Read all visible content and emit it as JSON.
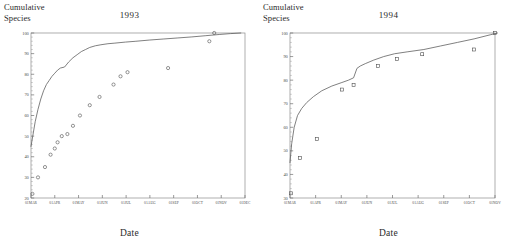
{
  "figure": {
    "panel_count": 2,
    "background_color": "#ffffff",
    "ink_color": "#4d4d4d"
  },
  "panels": [
    {
      "id": "panel-1993",
      "title": "1993",
      "ylabel_line1": "Cumulative",
      "ylabel_line2": "Species",
      "xlabel": "Date"
    },
    {
      "id": "panel-1994",
      "title": "1994",
      "ylabel_line1": "Cumulative",
      "ylabel_line2": "Species",
      "xlabel": "Date"
    }
  ],
  "chart_data": [
    {
      "type": "scatter",
      "title": "1993",
      "xlabel": "Date",
      "ylabel": "Cumulative Species",
      "grid": false,
      "legend": "none",
      "xlim": [
        "01MAR",
        "01DEC"
      ],
      "ylim": [
        20,
        100
      ],
      "yticks": [
        20,
        30,
        40,
        50,
        60,
        70,
        80,
        90,
        100
      ],
      "xticks": [
        "01MAR",
        "01APR",
        "01MAY",
        "01JUN",
        "01JUL",
        "01AUG",
        "01SEP",
        "01OCT",
        "01NOV",
        "01DEC"
      ],
      "series": [
        {
          "name": "Observed cumulative species",
          "marker": "open-circle",
          "x_days_from_01MAR": [
            2,
            10,
            20,
            28,
            34,
            38,
            44,
            52,
            60,
            70,
            84,
            98,
            118,
            128,
            138,
            196,
            255,
            262
          ],
          "x_labels": [
            "03MAR",
            "11MAR",
            "21MAR",
            "29MAR",
            "04APR",
            "08APR",
            "14APR",
            "22APR",
            "30APR",
            "10MAY",
            "24MAY",
            "07JUN",
            "27JUN",
            "07JUL",
            "17JUL",
            "13SEP",
            "11NOV",
            "18NOV"
          ],
          "values": [
            22,
            30,
            35,
            41,
            44,
            47,
            50,
            51,
            55,
            60,
            65,
            69,
            75,
            79,
            81,
            83,
            96,
            100
          ]
        },
        {
          "name": "Fitted accumulation curve",
          "marker": "none",
          "line": true,
          "x_days_from_01MAR": [
            0,
            3,
            6,
            10,
            14,
            18,
            22,
            26,
            30,
            34,
            38,
            42,
            48,
            54,
            60,
            66,
            72,
            78,
            84,
            92,
            100,
            110,
            120,
            135,
            150,
            170,
            190,
            210,
            230,
            250,
            270,
            285,
            300
          ],
          "values": [
            45,
            51,
            57,
            63,
            68,
            72,
            75,
            77,
            79,
            80.5,
            82,
            83,
            83.5,
            86,
            88,
            89.5,
            91,
            92,
            93,
            93.8,
            94.3,
            94.8,
            95.1,
            95.6,
            96.0,
            96.6,
            97.1,
            97.6,
            98.1,
            98.7,
            99.3,
            99.7,
            100
          ]
        }
      ]
    },
    {
      "type": "scatter",
      "title": "1994",
      "xlabel": "Date",
      "ylabel": "Cumulative Species",
      "grid": false,
      "legend": "none",
      "xlim": [
        "01MAR",
        "01NOV"
      ],
      "ylim": [
        30,
        100
      ],
      "yticks": [
        30,
        40,
        50,
        60,
        70,
        80,
        90,
        100
      ],
      "xticks": [
        "01MAR",
        "01APR",
        "01MAY",
        "01JUN",
        "01JUL",
        "01AUG",
        "01SEP",
        "01OCT",
        "01NOV"
      ],
      "series": [
        {
          "name": "Observed cumulative species",
          "marker": "open-square",
          "x_days_from_01MAR": [
            1,
            12,
            32,
            62,
            76,
            105,
            128,
            158,
            220,
            245
          ],
          "x_labels": [
            "02MAR",
            "13MAR",
            "02APR",
            "02MAY",
            "16MAY",
            "14JUN",
            "07JUL",
            "06AUG",
            "07OCT",
            "01NOV"
          ],
          "values": [
            32,
            47,
            55,
            76,
            78,
            86,
            89,
            91,
            93,
            100
          ]
        },
        {
          "name": "Fitted accumulation curve",
          "marker": "none",
          "line": true,
          "x_days_from_01MAR": [
            0,
            2,
            5,
            9,
            14,
            20,
            28,
            38,
            50,
            62,
            70,
            76,
            80,
            84,
            90,
            100,
            112,
            125,
            140,
            160,
            180,
            200,
            220,
            240,
            248
          ],
          "values": [
            45,
            53,
            60,
            65,
            68,
            70.5,
            73,
            75.5,
            77.5,
            79,
            80,
            81,
            85,
            86,
            87,
            88.5,
            90,
            91.2,
            92,
            93,
            94.5,
            96,
            97.5,
            99.3,
            100
          ]
        }
      ]
    }
  ]
}
